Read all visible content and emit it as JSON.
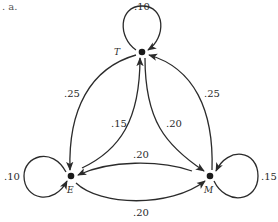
{
  "corner_label": ". a.",
  "nodes": {
    "T": {
      "label": "T",
      "x": 142,
      "y": 52
    },
    "E": {
      "label": "E",
      "x": 71,
      "y": 176
    },
    "M": {
      "label": "M",
      "x": 210,
      "y": 176
    }
  },
  "edges": {
    "T_T": {
      "from": "T",
      "to": "T",
      "prob": ".10"
    },
    "T_E": {
      "from": "T",
      "to": "E",
      "prob": ".25"
    },
    "E_T": {
      "from": "E",
      "to": "T",
      "prob": ".15"
    },
    "T_M": {
      "from": "T",
      "to": "M",
      "prob": ".20"
    },
    "M_T": {
      "from": "M",
      "to": "T",
      "prob": ".25"
    },
    "E_E": {
      "from": "E",
      "to": "E",
      "prob": ".10"
    },
    "M_E": {
      "from": "M",
      "to": "E",
      "prob": ".20"
    },
    "E_M": {
      "from": "E",
      "to": "M",
      "prob": ".20"
    },
    "M_M": {
      "from": "M",
      "to": "M",
      "prob": ".15"
    }
  },
  "colors": {
    "stroke": "#2b2b2b",
    "node": "#1a1a1a",
    "background": "#ffffff"
  }
}
